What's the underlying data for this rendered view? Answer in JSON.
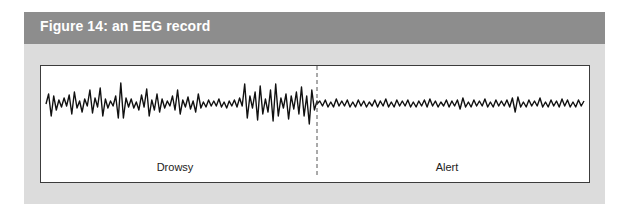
{
  "figure": {
    "title": "Figure 14: an EEG record",
    "colors": {
      "header": "#8d8d8d",
      "panel": "#dcdcdc",
      "plot_bg": "#ffffff",
      "trace": "#111111",
      "divider": "#555555"
    }
  },
  "chart_data": {
    "type": "line",
    "title": "Figure 14: an EEG record",
    "xlabel": "",
    "ylabel": "",
    "grid": false,
    "legend": null,
    "annotations": [
      {
        "text": "Drowsy",
        "region": "left"
      },
      {
        "text": "Alert",
        "region": "right"
      }
    ],
    "divider": {
      "style": "dashed",
      "position": "between Drowsy and Alert segments"
    },
    "series": [
      {
        "name": "Drowsy",
        "description": "high-amplitude, irregular, slower waves",
        "y": [
          0,
          10,
          -12,
          8,
          -6,
          4,
          -3,
          6,
          -2,
          9,
          -10,
          12,
          -4,
          3,
          -8,
          5,
          -2,
          14,
          -9,
          6,
          -3,
          16,
          -12,
          5,
          -4,
          3,
          -2,
          8,
          -14,
          21,
          -14,
          6,
          -3,
          5,
          -4,
          2,
          -6,
          9,
          -3,
          15,
          -12,
          4,
          -6,
          10,
          -8,
          5,
          -4,
          3,
          -2,
          8,
          -6,
          14,
          -10,
          4,
          -3,
          7,
          -5,
          3,
          -8,
          10,
          -4,
          2,
          -3,
          4,
          -2,
          3,
          -2,
          5,
          -3,
          2,
          -4,
          3,
          -2,
          4,
          -3,
          6,
          -2,
          20,
          -14,
          8,
          -4,
          12,
          -16,
          18,
          -10,
          5,
          -8,
          14,
          -17,
          20,
          -12,
          6,
          -4,
          10,
          -15,
          8,
          -5,
          12,
          -10,
          17,
          -12,
          8,
          -20,
          14,
          -6,
          3
        ]
      },
      {
        "name": "Alert",
        "description": "low-amplitude, fast waves",
        "y": [
          0,
          3,
          -2,
          4,
          -3,
          2,
          -3,
          5,
          -2,
          3,
          -2,
          4,
          -3,
          2,
          -3,
          4,
          -2,
          3,
          -3,
          2,
          -2,
          4,
          -3,
          3,
          -2,
          5,
          -3,
          2,
          -3,
          4,
          -2,
          3,
          -2,
          4,
          -3,
          2,
          -3,
          3,
          -2,
          4,
          -3,
          5,
          -2,
          3,
          -3,
          2,
          -2,
          4,
          -3,
          3,
          -2,
          4,
          -5,
          6,
          -3,
          2,
          -3,
          4,
          -2,
          3,
          -2,
          5,
          -3,
          2,
          -3,
          4,
          -2,
          3,
          -2,
          4,
          -3,
          6,
          -8,
          7,
          -3,
          2,
          -3,
          4,
          -2,
          3,
          -2,
          6,
          -3,
          2,
          -3,
          4,
          -2,
          3,
          -3,
          5,
          -2,
          4,
          -3,
          2,
          -3,
          4,
          -2,
          3
        ]
      }
    ]
  }
}
